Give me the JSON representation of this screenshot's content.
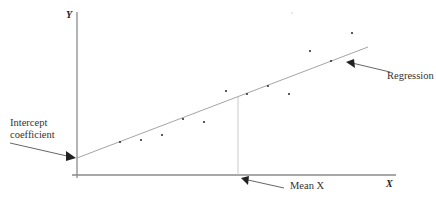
{
  "chart_data": {
    "type": "scatter",
    "title": "",
    "xlabel": "X",
    "ylabel": "Y",
    "grid": false,
    "axes": {
      "y_axis": {
        "x": 77,
        "y1": 12,
        "y2": 178
      },
      "x_axis": {
        "y": 175,
        "x1": 72,
        "x2": 396
      }
    },
    "points": [
      {
        "x": 120,
        "y": 142
      },
      {
        "x": 141,
        "y": 140
      },
      {
        "x": 162,
        "y": 135
      },
      {
        "x": 183,
        "y": 119
      },
      {
        "x": 204,
        "y": 122
      },
      {
        "x": 226,
        "y": 91
      },
      {
        "x": 247,
        "y": 94
      },
      {
        "x": 268,
        "y": 86
      },
      {
        "x": 289,
        "y": 94
      },
      {
        "x": 310,
        "y": 51
      },
      {
        "x": 331,
        "y": 61
      },
      {
        "x": 352,
        "y": 33
      }
    ],
    "stray_points": [
      {
        "x": 292,
        "y": 13
      }
    ],
    "regression_line": {
      "x1": 77,
      "y1": 158,
      "x2": 368,
      "y2": 47
    },
    "mean_x_line": {
      "x": 238,
      "y1": 97,
      "y2": 175
    },
    "annotations": [
      {
        "text": "Regression",
        "target": "regression line"
      },
      {
        "text": "Intercept coefficient",
        "target": "y-intercept"
      },
      {
        "text": "Mean X",
        "target": "mean of X on x-axis"
      }
    ]
  },
  "labels": {
    "y_axis": "Y",
    "x_axis": "X",
    "regression": "Regression",
    "intercept_line1": "Intercept",
    "intercept_line2": "coefficient",
    "mean_x": "Mean X"
  },
  "colors": {
    "axis": "#8a8a8a",
    "line": "#9a9a9a",
    "point": "#333333",
    "arrow": "#222222",
    "text": "#333333"
  }
}
